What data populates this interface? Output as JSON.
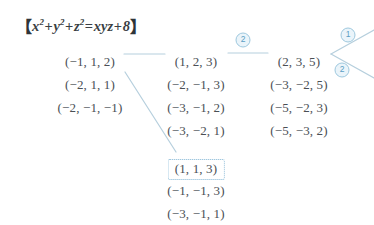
{
  "equation": {
    "open_bracket": "【",
    "close_bracket": "】",
    "text": "x² + y² + z² = xyz + 8",
    "terms": [
      "x",
      "y",
      "z",
      "xyz",
      "8"
    ],
    "exponent": "2"
  },
  "columns": {
    "left": {
      "name": "column-left",
      "x": 90,
      "items": [
        {
          "label": "(−1, 1, 2)",
          "y": 54
        },
        {
          "label": "(−2, 1, 1)",
          "y": 77
        },
        {
          "label": "(−2, −1, −1)",
          "y": 100
        }
      ]
    },
    "middle": {
      "name": "column-middle",
      "x": 196,
      "items": [
        {
          "label": "(1, 2, 3)",
          "y": 54
        },
        {
          "label": "(−2, −1, 3)",
          "y": 77
        },
        {
          "label": "(−3, −1, 2)",
          "y": 100
        },
        {
          "label": "(−3, −2, 1)",
          "y": 123
        }
      ]
    },
    "right": {
      "name": "column-right",
      "x": 299,
      "items": [
        {
          "label": "(2, 3, 5)",
          "y": 54
        },
        {
          "label": "(−3, −2, 5)",
          "y": 77
        },
        {
          "label": "(−5, −2, 3)",
          "y": 100
        },
        {
          "label": "(−5, −3, 2)",
          "y": 123
        }
      ]
    },
    "bottom": {
      "name": "column-bottom",
      "x": 196,
      "items": [
        {
          "label": "(1, 1, 3)",
          "y": 159,
          "boxed": true
        },
        {
          "label": "(−1, −1, 3)",
          "y": 183,
          "boxed": false
        },
        {
          "label": "(−3, −1, 1)",
          "y": 206,
          "boxed": false
        }
      ]
    }
  },
  "badges": [
    {
      "label": "2",
      "x": 243,
      "y": 40,
      "name": "step-badge-2-top"
    },
    {
      "label": "1",
      "x": 348,
      "y": 35,
      "name": "step-badge-1-right"
    },
    {
      "label": "2",
      "x": 342,
      "y": 70,
      "name": "step-badge-2-right"
    }
  ],
  "colors": {
    "connector": "#b6cfdd",
    "badge_fill": "#eaf4fa",
    "badge_border": "#9ec8de",
    "badge_text": "#5a9ec4",
    "box_border": "#7fb4d4",
    "text": "#4a4f55",
    "equation_text": "#3a3f44",
    "background": "#ffffff"
  },
  "connectors": [
    {
      "name": "wire-left-to-middle",
      "x1": 124,
      "y1": 54,
      "x2": 165,
      "y2": 54
    },
    {
      "name": "wire-middle-to-right",
      "x1": 228,
      "y1": 53,
      "x2": 268,
      "y2": 53
    },
    {
      "name": "wire-right-branch-upper",
      "x1": 331,
      "y1": 54,
      "x2": 374,
      "y2": 30
    },
    {
      "name": "wire-right-branch-lower",
      "x1": 331,
      "y1": 54,
      "x2": 374,
      "y2": 78
    },
    {
      "name": "wire-left-to-bottom-box",
      "x1": 125,
      "y1": 72,
      "x2": 176,
      "y2": 152
    }
  ]
}
